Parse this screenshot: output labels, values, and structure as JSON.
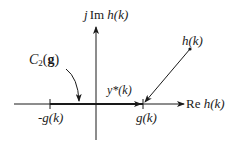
{
  "diagram": {
    "type": "complex-plane projection",
    "labels": {
      "imag_axis_prefix": "j",
      "imag_axis_im": "Im",
      "imag_axis_func": "h(k)",
      "real_axis_re": "Re",
      "real_axis_func": "h(k)",
      "point_h": "h(k)",
      "constraint_set_C": "C",
      "constraint_set_sub": "2",
      "constraint_set_open": "(",
      "constraint_set_arg": "g",
      "constraint_set_close": ")",
      "projection": "y*(k)",
      "neg_g": "-g(k)",
      "pos_g": "g(k)"
    },
    "colors": {
      "line": "#1a1a1a",
      "background": "#ffffff"
    }
  }
}
